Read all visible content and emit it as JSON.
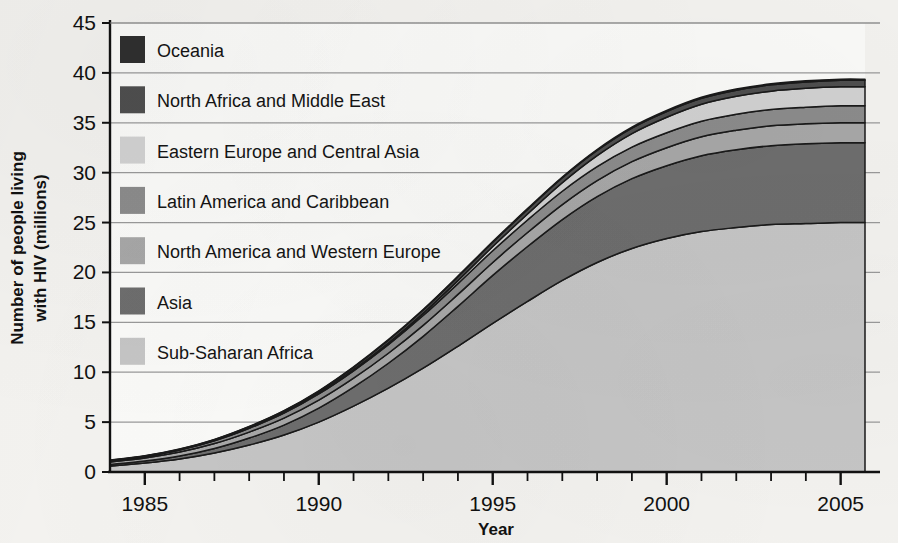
{
  "chart_data": {
    "type": "area",
    "stacked": true,
    "title": "",
    "subtitle": "",
    "xlabel": "Year",
    "ylabel": "Number of people living with HIV (millions)",
    "xlim": [
      1984,
      2005.7
    ],
    "ylim": [
      0,
      45
    ],
    "yticks": [
      0,
      5,
      10,
      15,
      20,
      25,
      30,
      35,
      40,
      45
    ],
    "ytick_labels": [
      "0",
      "5",
      "10",
      "15",
      "20",
      "25",
      "30",
      "35",
      "40",
      "45"
    ],
    "xticks_major": [
      1985,
      1990,
      1995,
      2000,
      2005
    ],
    "xtick_labels": [
      "1985",
      "1990",
      "1995",
      "2000",
      "2005"
    ],
    "xticks_minor_step": 1,
    "grid": "horizontal",
    "legend_position": "upper-left-inside",
    "stack_order_bottom_to_top": [
      "Sub-Saharan Africa",
      "Asia",
      "North America and Western Europe",
      "Latin America and Caribbean",
      "Eastern Europe and Central Asia",
      "North Africa and Middle East",
      "Oceania"
    ],
    "x": [
      1984,
      1985,
      1986,
      1987,
      1988,
      1989,
      1990,
      1991,
      1992,
      1993,
      1994,
      1995,
      1996,
      1997,
      1998,
      1999,
      2000,
      2001,
      2002,
      2003,
      2004,
      2005,
      2005.7
    ],
    "series": [
      {
        "name": "Sub-Saharan Africa",
        "color": "#c6c6c6",
        "values": [
          0.6,
          0.9,
          1.3,
          1.9,
          2.7,
          3.7,
          5.0,
          6.6,
          8.4,
          10.4,
          12.6,
          14.9,
          17.1,
          19.2,
          21.0,
          22.4,
          23.4,
          24.1,
          24.5,
          24.8,
          24.9,
          25.0,
          25.0
        ]
      },
      {
        "name": "Asia",
        "color": "#6e6e6e",
        "values": [
          0.15,
          0.2,
          0.3,
          0.45,
          0.7,
          1.0,
          1.4,
          1.9,
          2.5,
          3.2,
          4.0,
          4.8,
          5.5,
          6.1,
          6.6,
          7.0,
          7.3,
          7.6,
          7.8,
          7.9,
          8.0,
          8.0,
          8.0
        ]
      },
      {
        "name": "North America and Western Europe",
        "color": "#a8a8a8",
        "values": [
          0.25,
          0.3,
          0.4,
          0.5,
          0.6,
          0.7,
          0.8,
          0.9,
          1.0,
          1.1,
          1.2,
          1.3,
          1.4,
          1.5,
          1.6,
          1.7,
          1.8,
          1.9,
          1.95,
          2.0,
          2.0,
          2.0,
          2.0
        ]
      },
      {
        "name": "Latin America and Caribbean",
        "color": "#8c8c8c",
        "values": [
          0.12,
          0.15,
          0.2,
          0.28,
          0.38,
          0.5,
          0.62,
          0.74,
          0.86,
          0.98,
          1.08,
          1.18,
          1.26,
          1.34,
          1.4,
          1.46,
          1.5,
          1.55,
          1.6,
          1.62,
          1.65,
          1.7,
          1.7
        ]
      },
      {
        "name": "Eastern Europe and Central Asia",
        "color": "#d2d2d2",
        "values": [
          0.02,
          0.02,
          0.03,
          0.04,
          0.05,
          0.07,
          0.09,
          0.12,
          0.16,
          0.22,
          0.3,
          0.42,
          0.6,
          0.85,
          1.1,
          1.35,
          1.55,
          1.7,
          1.8,
          1.85,
          1.9,
          1.9,
          1.9
        ]
      },
      {
        "name": "North Africa and Middle East",
        "color": "#4f4f4f",
        "values": [
          0.03,
          0.04,
          0.05,
          0.07,
          0.1,
          0.14,
          0.18,
          0.23,
          0.28,
          0.33,
          0.38,
          0.42,
          0.46,
          0.5,
          0.53,
          0.56,
          0.58,
          0.6,
          0.62,
          0.63,
          0.64,
          0.65,
          0.65
        ]
      },
      {
        "name": "Oceania",
        "color": "#2f2f2f",
        "values": [
          0.02,
          0.02,
          0.03,
          0.03,
          0.04,
          0.04,
          0.05,
          0.05,
          0.06,
          0.06,
          0.07,
          0.07,
          0.08,
          0.08,
          0.09,
          0.09,
          0.1,
          0.1,
          0.11,
          0.11,
          0.12,
          0.12,
          0.12
        ]
      }
    ],
    "totals": [
      1.19,
      1.63,
      2.31,
      3.27,
      4.57,
      6.15,
      8.14,
      10.54,
      13.26,
      16.29,
      19.63,
      23.09,
      26.4,
      29.57,
      32.32,
      34.56,
      36.23,
      37.55,
      38.33,
      38.91,
      39.21,
      39.37,
      39.37
    ]
  },
  "legend": {
    "items": [
      {
        "label": "Oceania",
        "color": "#2f2f2f"
      },
      {
        "label": "North Africa and Middle East",
        "color": "#4f4f4f"
      },
      {
        "label": "Eastern Europe and Central Asia",
        "color": "#d2d2d2"
      },
      {
        "label": "Latin America and Caribbean",
        "color": "#8c8c8c"
      },
      {
        "label": "North America and Western Europe",
        "color": "#a8a8a8"
      },
      {
        "label": "Asia",
        "color": "#6e6e6e"
      },
      {
        "label": "Sub-Saharan Africa",
        "color": "#c6c6c6"
      }
    ]
  },
  "axes": {
    "y_title": "Number of people living with HIV (millions)",
    "y_title_line1": "Number of people living",
    "y_title_line2": "with HIV (millions)",
    "x_title": "Year",
    "y_labels": [
      "45",
      "40",
      "35",
      "30",
      "25",
      "20",
      "15",
      "10",
      "5",
      "0"
    ],
    "x_labels": [
      "1985",
      "1990",
      "1995",
      "2000",
      "2005"
    ]
  },
  "style": {
    "background": "#f4f3f0",
    "plot_background": "#fbfbf9",
    "axis_color": "#111111",
    "grid_color": "#9a9a9a",
    "outline_color": "#1a1a1a"
  }
}
